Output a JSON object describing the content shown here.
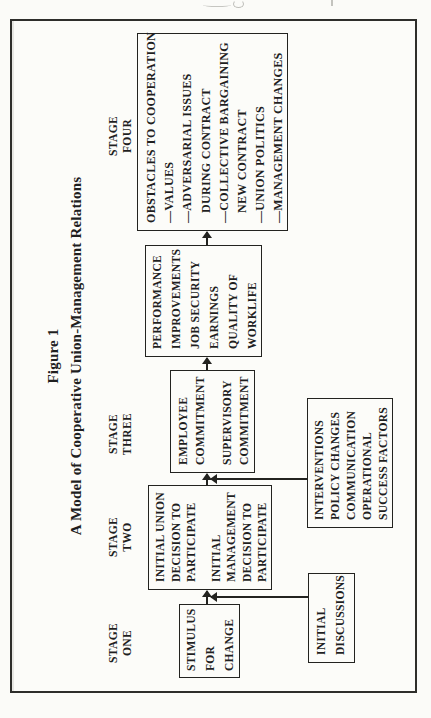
{
  "colors": {
    "ink": "#1f1f1f",
    "paper": "#fbfbf8",
    "frame": "#2e2e2b"
  },
  "figure": {
    "label": "Figure 1",
    "title": "A Model of Cooperative Union-Management Relations",
    "stage_labels": {
      "one": [
        "STAGE",
        "ONE"
      ],
      "two": [
        "STAGE",
        "TWO"
      ],
      "three": [
        "STAGE",
        "THREE"
      ],
      "four": [
        "STAGE",
        "FOUR"
      ]
    },
    "boxes": {
      "stimulus": {
        "lines": [
          "STIMULUS",
          "FOR",
          "CHANGE"
        ]
      },
      "discussions": {
        "lines": [
          "INITIAL",
          "DISCUSSIONS"
        ]
      },
      "union_mgmt": {
        "lines": [
          "INITIAL UNION",
          "DECISION TO",
          "PARTICIPATE",
          "INITIAL",
          "MANAGEMENT",
          "DECISION TO",
          "PARTICIPATE"
        ]
      },
      "interventions": {
        "lines": [
          "INTERVENTIONS",
          "POLICY CHANGES",
          "COMMUNICATION",
          "OPERATIONAL",
          "SUCCESS FACTORS"
        ]
      },
      "employee": {
        "lines": [
          "EMPLOYEE",
          "COMMITMENT",
          "SUPERVISORY",
          "COMMITMENT"
        ]
      },
      "performance": {
        "lines": [
          "PERFORMANCE",
          "IMPROVEMENTS",
          "JOB SECURITY",
          "EARNINGS",
          "QUALITY OF",
          "WORKLIFE"
        ]
      },
      "obstacles": {
        "lines": [
          "OBSTACLES TO COOPERATION",
          "—VALUES",
          "—ADVERSARIAL ISSUES",
          "DURING CONTRACT",
          "—COLLECTIVE BARGAINING",
          "NEW CONTRACT",
          "—UNION POLITICS",
          "—MANAGEMENT CHANGES"
        ]
      }
    }
  }
}
